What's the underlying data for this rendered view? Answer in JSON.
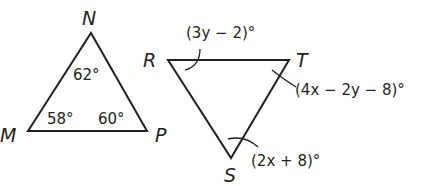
{
  "triangle_MNP": {
    "vertices": {
      "M": "M",
      "N": "N",
      "P": "P"
    },
    "angles": {
      "N": "62°",
      "M": "58°",
      "P": "60°"
    }
  },
  "triangle_RTS": {
    "vertices": {
      "R": "R",
      "T": "T",
      "S": "S"
    },
    "angles": {
      "R": "(3y − 2)°",
      "T": "(4x − 2y − 8)°",
      "S": "(2x + 8)°"
    }
  }
}
